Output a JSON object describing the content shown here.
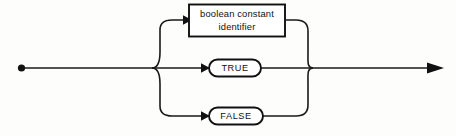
{
  "diagram": {
    "kind": "railroad-syntax-diagram",
    "title": "boolean constant",
    "colors": {
      "background": "#fdfdfc",
      "line": "#1a1a1a",
      "node_fill": "#ffffff",
      "node_stroke": "#111111",
      "text": "#111111"
    },
    "start_marker": "start-dot",
    "end_marker": "arrow-right",
    "branch_count": 3,
    "nodes": [
      {
        "id": "boolean-constant-identifier",
        "shape": "rectangle",
        "line1": "boolean constant",
        "line2": "identifier",
        "branch": "top"
      },
      {
        "id": "true",
        "shape": "oval",
        "label": "TRUE",
        "branch": "middle"
      },
      {
        "id": "false",
        "shape": "oval",
        "label": "FALSE",
        "branch": "bottom"
      }
    ]
  }
}
